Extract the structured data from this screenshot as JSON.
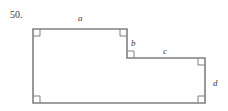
{
  "figure": {
    "problem_number": "50.",
    "background_color": "#fefefe",
    "stroke_color": "#808080",
    "label_color": "#3a3a3a",
    "stroke_width": 1.6,
    "width": 228,
    "height": 111,
    "side_labels": [
      {
        "id": "a",
        "text": "a",
        "x": 78,
        "y": 14,
        "side": "top-horizontal"
      },
      {
        "id": "b",
        "text": "b",
        "x": 131,
        "y": 39,
        "side": "upper-right-vertical"
      },
      {
        "id": "c",
        "text": "c",
        "x": 163,
        "y": 47,
        "side": "middle-horizontal"
      },
      {
        "id": "d",
        "text": "d",
        "x": 213,
        "y": 79,
        "side": "far-right-vertical"
      }
    ],
    "vertices": [
      {
        "name": "top-left",
        "x": 33,
        "y": 29
      },
      {
        "name": "top-right",
        "x": 127,
        "y": 29
      },
      {
        "name": "step-inner",
        "x": 127,
        "y": 58
      },
      {
        "name": "step-right",
        "x": 205,
        "y": 58
      },
      {
        "name": "bottom-right",
        "x": 205,
        "y": 103
      },
      {
        "name": "bottom-left",
        "x": 33,
        "y": 103
      }
    ],
    "outline_path": "M 33 29 L 127 29 L 127 58 L 205 58 L 205 103 L 33 103 Z",
    "right_angle_markers": [
      {
        "name": "right-angle-top-left",
        "x": 33,
        "y": 29,
        "dx": 1,
        "dy": 1,
        "size": 7
      },
      {
        "name": "right-angle-top-right",
        "x": 127,
        "y": 29,
        "dx": -1,
        "dy": 1,
        "size": 7
      },
      {
        "name": "right-angle-step-inner",
        "x": 127,
        "y": 58,
        "dx": 1,
        "dy": -1,
        "size": 7
      },
      {
        "name": "right-angle-step-right",
        "x": 205,
        "y": 58,
        "dx": -1,
        "dy": 1,
        "size": 7
      },
      {
        "name": "right-angle-bottom-right",
        "x": 205,
        "y": 103,
        "dx": -1,
        "dy": -1,
        "size": 7
      },
      {
        "name": "right-angle-bottom-left",
        "x": 33,
        "y": 103,
        "dx": 1,
        "dy": -1,
        "size": 7
      }
    ]
  }
}
